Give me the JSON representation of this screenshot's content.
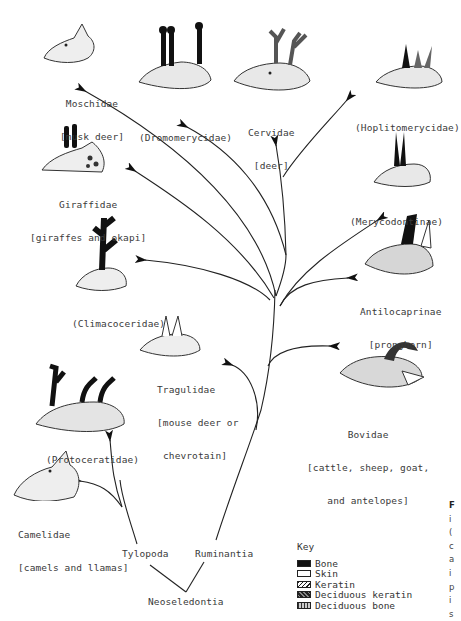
{
  "diagram": {
    "type": "phylogenetic-tree",
    "root": "Neoseledontia",
    "branches": [
      {
        "name": "Tylopoda",
        "children": [
          "Camelidae",
          "Protoceratidae"
        ]
      },
      {
        "name": "Ruminantia",
        "children": [
          "Tragulidae",
          "Climacoceridae",
          "Giraffidae",
          "Moschidae",
          "Dromomerycidae",
          "Cervidae",
          "Hoplitomerycidae",
          "Merycodontinae",
          "Antilocaprinae",
          "Bovidae"
        ]
      }
    ]
  },
  "taxa": {
    "moschidae": {
      "name": "Moschidae",
      "common": "[musk deer]"
    },
    "dromomerycidae": {
      "name": "(Dromomerycidae)"
    },
    "cervidae": {
      "name": "Cervidae",
      "common": "[deer]"
    },
    "hoplitomerycidae": {
      "name": "(Hoplitomerycidae)"
    },
    "giraffidae": {
      "name": "Giraffidae",
      "common": "[giraffes and okapi]"
    },
    "merycodontinae": {
      "name": "(Merycodontinae)"
    },
    "climacoceridae": {
      "name": "(Climacoceridae)"
    },
    "antilocaprinae": {
      "name": "Antilocaprinae",
      "common": "[pronghorn]"
    },
    "tragulidae": {
      "name": "Tragulidae",
      "common": "[mouse deer or",
      "common2": "chevrotain]"
    },
    "bovidae": {
      "name": "Bovidae",
      "common": "[cattle, sheep, goat,",
      "common2": "and antelopes]"
    },
    "protoceratidae": {
      "name": "(Protoceratidae)"
    },
    "camelidae": {
      "name": "Camelidae",
      "common": "[camels and llamas]"
    }
  },
  "nodes": {
    "tylopoda": "Tylopoda",
    "ruminantia": "Ruminantia",
    "neoseledontia": "Neoseledontia"
  },
  "key": {
    "title": "Key",
    "items": [
      {
        "label": "Bone",
        "pattern": "solid-black"
      },
      {
        "label": "Skin",
        "pattern": "white"
      },
      {
        "label": "Keratin",
        "pattern": "diagonal-hatch"
      },
      {
        "label": "Deciduous keratin",
        "pattern": "cross-hatch"
      },
      {
        "label": "Deciduous bone",
        "pattern": "stipple"
      }
    ]
  },
  "edge_text": [
    "F",
    "i",
    "(",
    "c",
    "a",
    "i",
    "p",
    "i",
    "s"
  ]
}
